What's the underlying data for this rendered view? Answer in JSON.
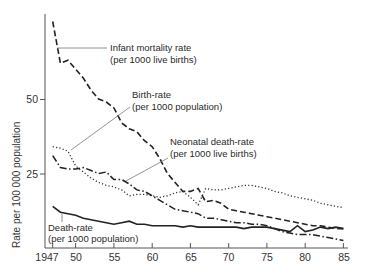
{
  "chart_data": {
    "type": "line",
    "title": "",
    "xlabel": "",
    "ylabel": "Rate per 100 000 population",
    "xlim": [
      1947,
      1985
    ],
    "ylim": [
      0,
      80
    ],
    "x_ticks": [
      "1947",
      "50",
      "55",
      "60",
      "65",
      "70",
      "75",
      "80",
      "85"
    ],
    "y_ticks": [
      "25",
      "50"
    ],
    "grid": false,
    "legend": "inline labels with leader lines",
    "series": [
      {
        "name": "Infant mortality rate",
        "sublabel": "(per 1000 live births)",
        "style": "dashed",
        "points": [
          [
            1947,
            76
          ],
          [
            1948,
            62
          ],
          [
            1949,
            63
          ],
          [
            1950,
            60
          ],
          [
            1951,
            57
          ],
          [
            1952,
            53
          ],
          [
            1953,
            50
          ],
          [
            1954,
            49
          ],
          [
            1955,
            47
          ],
          [
            1956,
            42
          ],
          [
            1957,
            40
          ],
          [
            1958,
            39
          ],
          [
            1959,
            36
          ],
          [
            1960,
            34
          ],
          [
            1961,
            30
          ],
          [
            1962,
            25
          ],
          [
            1963,
            22
          ],
          [
            1964,
            19
          ],
          [
            1965,
            19
          ],
          [
            1966,
            20
          ],
          [
            1967,
            15.5
          ],
          [
            1968,
            16
          ],
          [
            1969,
            15
          ],
          [
            1970,
            13
          ],
          [
            1971,
            12.5
          ],
          [
            1972,
            12
          ],
          [
            1973,
            11.5
          ],
          [
            1974,
            11
          ],
          [
            1975,
            10.5
          ],
          [
            1976,
            10
          ],
          [
            1977,
            9.5
          ],
          [
            1978,
            9
          ],
          [
            1979,
            8.5
          ],
          [
            1980,
            8
          ],
          [
            1981,
            7.5
          ],
          [
            1982,
            7.5
          ],
          [
            1983,
            7
          ],
          [
            1984,
            6.5
          ],
          [
            1985,
            6.5
          ]
        ]
      },
      {
        "name": "Birth-rate",
        "sublabel": "(per 1000 population)",
        "style": "dotted",
        "points": [
          [
            1947,
            34
          ],
          [
            1948,
            33.5
          ],
          [
            1949,
            32.5
          ],
          [
            1950,
            27.5
          ],
          [
            1951,
            25.5
          ],
          [
            1952,
            23.5
          ],
          [
            1953,
            22
          ],
          [
            1954,
            21
          ],
          [
            1955,
            20.5
          ],
          [
            1956,
            19.5
          ],
          [
            1957,
            17.5
          ],
          [
            1958,
            18
          ],
          [
            1959,
            18
          ],
          [
            1960,
            17.5
          ],
          [
            1961,
            17
          ],
          [
            1962,
            17.5
          ],
          [
            1963,
            18.5
          ],
          [
            1964,
            19
          ],
          [
            1965,
            17
          ],
          [
            1966,
            14.5
          ],
          [
            1967,
            20
          ],
          [
            1968,
            19.5
          ],
          [
            1969,
            19.5
          ],
          [
            1970,
            20
          ],
          [
            1971,
            20.5
          ],
          [
            1972,
            21
          ],
          [
            1973,
            21
          ],
          [
            1974,
            20.5
          ],
          [
            1975,
            20
          ],
          [
            1976,
            19
          ],
          [
            1977,
            18.5
          ],
          [
            1978,
            17.5
          ],
          [
            1979,
            17
          ],
          [
            1980,
            16.5
          ],
          [
            1981,
            16
          ],
          [
            1982,
            15
          ],
          [
            1983,
            14.5
          ],
          [
            1984,
            14
          ],
          [
            1985,
            13.5
          ]
        ]
      },
      {
        "name": "Neonatal death-rate",
        "sublabel": "(per 1000 live births)",
        "style": "dash-dot",
        "points": [
          [
            1947,
            31
          ],
          [
            1948,
            27
          ],
          [
            1949,
            26.5
          ],
          [
            1950,
            26.5
          ],
          [
            1951,
            27
          ],
          [
            1952,
            26
          ],
          [
            1953,
            25
          ],
          [
            1954,
            25.5
          ],
          [
            1955,
            23
          ],
          [
            1956,
            23
          ],
          [
            1957,
            21.5
          ],
          [
            1958,
            19.5
          ],
          [
            1959,
            19
          ],
          [
            1960,
            17.5
          ],
          [
            1961,
            16
          ],
          [
            1962,
            14.5
          ],
          [
            1963,
            13
          ],
          [
            1964,
            12.5
          ],
          [
            1965,
            12
          ],
          [
            1966,
            11.5
          ],
          [
            1967,
            10
          ],
          [
            1968,
            10
          ],
          [
            1969,
            9.5
          ],
          [
            1970,
            9
          ],
          [
            1971,
            8.5
          ],
          [
            1972,
            8.5
          ],
          [
            1973,
            8
          ],
          [
            1974,
            8
          ],
          [
            1975,
            7.5
          ],
          [
            1976,
            6.5
          ],
          [
            1977,
            5.5
          ],
          [
            1978,
            5
          ],
          [
            1979,
            4.5
          ],
          [
            1980,
            4.5
          ],
          [
            1981,
            4.5
          ],
          [
            1982,
            4
          ],
          [
            1983,
            3.5
          ],
          [
            1984,
            3
          ],
          [
            1985,
            2.5
          ]
        ]
      },
      {
        "name": "Death-rate",
        "sublabel": "(per 1000 population)",
        "style": "solid",
        "points": [
          [
            1947,
            14
          ],
          [
            1948,
            12
          ],
          [
            1949,
            11.5
          ],
          [
            1950,
            11
          ],
          [
            1951,
            10
          ],
          [
            1952,
            9.5
          ],
          [
            1953,
            9
          ],
          [
            1954,
            8.5
          ],
          [
            1955,
            8
          ],
          [
            1956,
            8.5
          ],
          [
            1957,
            9
          ],
          [
            1958,
            8
          ],
          [
            1959,
            8
          ],
          [
            1960,
            7.5
          ],
          [
            1961,
            7.5
          ],
          [
            1962,
            7.5
          ],
          [
            1963,
            7.5
          ],
          [
            1964,
            7
          ],
          [
            1965,
            7.5
          ],
          [
            1966,
            7
          ],
          [
            1967,
            7
          ],
          [
            1968,
            7
          ],
          [
            1969,
            7
          ],
          [
            1970,
            7
          ],
          [
            1971,
            7
          ],
          [
            1972,
            6.5
          ],
          [
            1973,
            7
          ],
          [
            1974,
            7
          ],
          [
            1975,
            7
          ],
          [
            1976,
            6.5
          ],
          [
            1977,
            6
          ],
          [
            1978,
            5.5
          ],
          [
            1979,
            7.5
          ],
          [
            1980,
            5.5
          ],
          [
            1981,
            6
          ],
          [
            1982,
            7
          ],
          [
            1983,
            6.5
          ],
          [
            1984,
            7
          ],
          [
            1985,
            6.5
          ]
        ]
      }
    ]
  },
  "labels": {
    "y_axis": "Rate per 100 000 population",
    "infant_line1": "Infant mortality rate",
    "infant_line2": "(per 1000 live births)",
    "birth_line1": "Birth-rate",
    "birth_line2": "(per 1000 population)",
    "neonatal_line1": "Neonatal death-rate",
    "neonatal_line2": "(per 1000 live births)",
    "death_line1": "Death-rate",
    "death_line2": "(per 1000 population)"
  },
  "colors": {
    "ink": "#222222",
    "leader": "#666666"
  }
}
